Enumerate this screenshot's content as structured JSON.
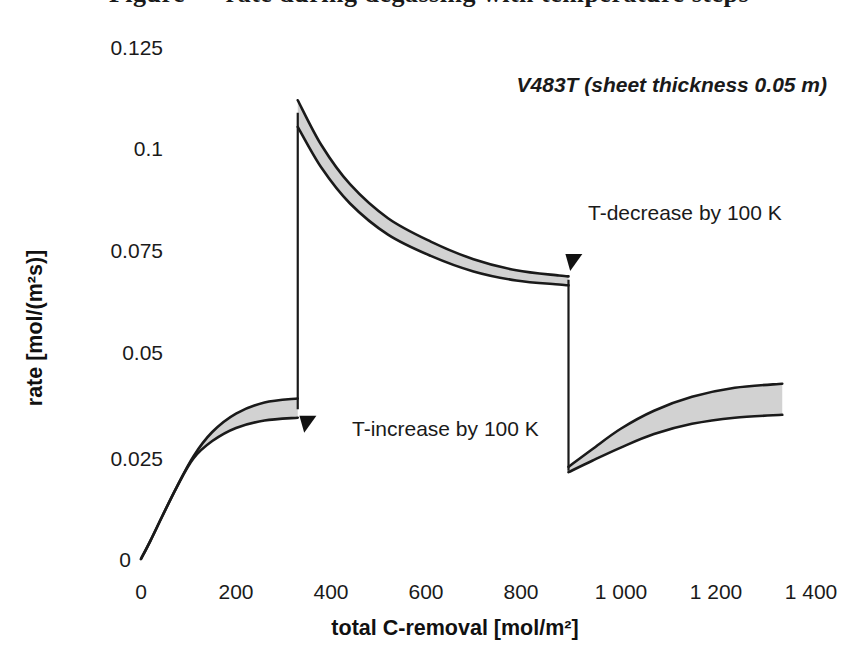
{
  "page": {
    "cropped_caption_above": "Figure — rate during degassing with temperature steps"
  },
  "chart_data": {
    "type": "line",
    "title": "",
    "xlabel": "total C-removal [mol/m²]",
    "ylabel": "rate [mol/(m²s)]",
    "xlim": [
      0,
      1400
    ],
    "ylim": [
      0,
      0.125
    ],
    "grid": false,
    "legend": false,
    "xticks": [
      "0",
      "200",
      "400",
      "600",
      "800",
      "1 000",
      "1 200",
      "1 400"
    ],
    "xtick_values": [
      0,
      200,
      400,
      600,
      800,
      1000,
      1200,
      1400
    ],
    "yticks": [
      "0",
      "0.025",
      "0.05",
      "0.075",
      "0.1",
      "0.125"
    ],
    "ytick_values": [
      0,
      0.025,
      0.05,
      0.075,
      0.1,
      0.125
    ],
    "band_fill": "#d2d2d2",
    "line_color": "#1a1a1a",
    "series": [
      {
        "name": "upper bound",
        "x": [
          0,
          20,
          45,
          75,
          110,
          150,
          200,
          260,
          330,
          330,
          380,
          440,
          520,
          610,
          700,
          790,
          880,
          900,
          900,
          950,
          1010,
          1080,
          1160,
          1250,
          1350
        ],
        "values": [
          0.0,
          0.0045,
          0.0105,
          0.0175,
          0.025,
          0.031,
          0.0355,
          0.0382,
          0.0392,
          0.112,
          0.101,
          0.0915,
          0.0832,
          0.0775,
          0.0732,
          0.0705,
          0.0692,
          0.069,
          0.0225,
          0.0268,
          0.0318,
          0.0362,
          0.0396,
          0.0418,
          0.0428
        ]
      },
      {
        "name": "lower bound",
        "x": [
          0,
          20,
          45,
          75,
          110,
          150,
          200,
          260,
          330,
          330,
          380,
          440,
          520,
          610,
          700,
          790,
          880,
          900,
          900,
          950,
          1010,
          1080,
          1160,
          1250,
          1350
        ],
        "values": [
          0.0,
          0.0045,
          0.0105,
          0.0175,
          0.0245,
          0.0288,
          0.032,
          0.0338,
          0.0345,
          0.1055,
          0.0955,
          0.0868,
          0.0792,
          0.074,
          0.0702,
          0.068,
          0.067,
          0.0668,
          0.0212,
          0.024,
          0.0272,
          0.0305,
          0.033,
          0.0345,
          0.0352
        ]
      }
    ],
    "transitions": [
      {
        "x": 330,
        "from": 0.0368,
        "to": 0.1087,
        "label": "T-increase by 100 K"
      },
      {
        "x": 900,
        "from": 0.0679,
        "to": 0.0218,
        "label": "T-decrease by 100 K"
      }
    ],
    "annotations": [
      {
        "id": "series-note",
        "text": "V483T (sheet thickness 0.05 m)",
        "x": 795,
        "y": 0.1085
      },
      {
        "id": "t-increase",
        "text": "T-increase by 100 K",
        "x": 480,
        "y": 0.0355
      },
      {
        "id": "t-decrease",
        "text": "T-decrease by 100 K",
        "x": 1040,
        "y": 0.079
      }
    ],
    "markers": [
      {
        "id": "arrow-t-increase",
        "shape": "triangle-down",
        "x": 340,
        "y": 0.0345
      },
      {
        "id": "arrow-t-decrease",
        "shape": "triangle-down",
        "x": 900,
        "y": 0.074
      }
    ]
  }
}
